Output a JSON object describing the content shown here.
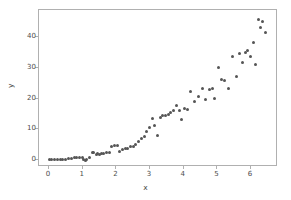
{
  "chart_data": {
    "type": "scatter",
    "title": "",
    "xlabel": "x",
    "ylabel": "y",
    "xlim": [
      -0.3,
      6.8
    ],
    "ylim": [
      -2.2,
      48.8
    ],
    "xticks": [
      0,
      1,
      2,
      3,
      4,
      5,
      6
    ],
    "yticks": [
      0,
      10,
      20,
      30,
      40
    ],
    "xticklabels": [
      "0",
      "1",
      "2",
      "3",
      "4",
      "5",
      "6"
    ],
    "yticklabels": [
      "0",
      "10",
      "20",
      "30",
      "40"
    ],
    "grid": false,
    "legend": null,
    "marker": "circle",
    "marker_color": "#555555",
    "marker_size": 3,
    "frame_color": "#b0b0b0",
    "background": "#ffffff",
    "n_points": 80,
    "x": [
      0.0,
      0.08,
      0.16,
      0.25,
      0.33,
      0.41,
      0.49,
      0.58,
      0.66,
      0.74,
      0.82,
      0.9,
      0.99,
      1.02,
      1.07,
      1.12,
      1.2,
      1.28,
      1.33,
      1.4,
      1.45,
      1.5,
      1.56,
      1.62,
      1.7,
      1.78,
      1.86,
      1.94,
      2.02,
      2.1,
      2.18,
      2.26,
      2.34,
      2.42,
      2.5,
      2.58,
      2.66,
      2.74,
      2.82,
      2.9,
      2.98,
      3.06,
      3.14,
      3.22,
      3.3,
      3.38,
      3.46,
      3.54,
      3.62,
      3.7,
      3.78,
      3.86,
      3.94,
      4.02,
      4.1,
      4.2,
      4.32,
      4.44,
      4.56,
      4.66,
      4.76,
      4.86,
      4.92,
      5.02,
      5.12,
      5.22,
      5.34,
      5.46,
      5.56,
      5.66,
      5.74,
      5.82,
      5.9,
      5.98,
      6.06,
      6.14,
      6.22,
      6.28,
      6.34,
      6.42
    ],
    "y": [
      0.2,
      0.15,
      0.25,
      0.3,
      0.28,
      0.35,
      0.4,
      0.55,
      0.6,
      0.75,
      0.85,
      0.95,
      0.8,
      0.1,
      0.05,
      0.3,
      0.9,
      2.4,
      2.6,
      2.0,
      2.3,
      2.0,
      2.2,
      2.1,
      2.5,
      2.6,
      4.6,
      4.9,
      4.7,
      2.7,
      3.6,
      3.8,
      3.9,
      4.3,
      4.6,
      5.0,
      6.2,
      7.0,
      7.6,
      9.4,
      10.6,
      13.4,
      11.2,
      8.0,
      13.8,
      14.4,
      14.6,
      14.8,
      15.6,
      16.0,
      17.8,
      16.2,
      13.2,
      16.8,
      16.6,
      22.4,
      19.0,
      20.8,
      23.2,
      19.6,
      23.0,
      23.2,
      20.0,
      30.2,
      26.2,
      26.0,
      23.2,
      33.6,
      27.2,
      34.6,
      31.8,
      35.0,
      35.8,
      33.8,
      38.2,
      31.2,
      45.6,
      43.0,
      45.0,
      41.4
    ]
  }
}
